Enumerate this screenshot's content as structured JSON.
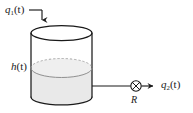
{
  "figure": {
    "kind": "engineering-schematic",
    "width": 193,
    "height": 113,
    "colors": {
      "stroke": "#1a1a1a",
      "fluid_fill": "#e9e9e9",
      "fluid_edge": "#9a9a9a",
      "background": "#ffffff"
    }
  },
  "labels": {
    "inflow": {
      "base": "q",
      "subscript": "1",
      "argument": "(t)",
      "full": "q1(t)",
      "meaning": "inflow-rate"
    },
    "level": {
      "base": "h",
      "subscript": "",
      "argument": "(t)",
      "full": "h(t)",
      "meaning": "liquid-height"
    },
    "outflow": {
      "base": "q",
      "subscript": "2",
      "argument": "(t)",
      "full": "q2(t)",
      "meaning": "outflow-rate"
    },
    "resistance": {
      "base": "R",
      "full": "R",
      "meaning": "valve-resistance"
    }
  },
  "elements": {
    "tank": {
      "name": "cylindrical-tank",
      "top_ellipse": {
        "cx": 61.5,
        "cy": 33,
        "rx": 30.5,
        "ry": 7.5
      },
      "fluid_ellipse": {
        "cx": 61.5,
        "cy": 68,
        "rx": 30.5,
        "ry": 9.5
      },
      "bottom_ellipse": {
        "cx": 61.5,
        "cy": 97,
        "rx": 30.5,
        "ry": 8
      },
      "left_wall_x": 31,
      "right_wall_x": 92,
      "top_y": 33,
      "bottom_y": 97
    },
    "inlet_pipe": {
      "name": "inlet-arrow",
      "horizontal_from_x": 29,
      "horizontal_to_x": 42,
      "horizontal_y": 10,
      "vertical_from_y": 10,
      "vertical_to_y": 26
    },
    "outlet_pipe": {
      "name": "outlet-pipe",
      "y": 86,
      "from_x": 92,
      "to_x": 131
    },
    "valve": {
      "name": "valve-symbol",
      "cx": 136,
      "cy": 86,
      "r": 5.2,
      "glyph": "circle-with-x"
    },
    "outlet_arrow": {
      "name": "outflow-arrow",
      "from_x": 141,
      "to_x": 159,
      "y": 86
    }
  }
}
